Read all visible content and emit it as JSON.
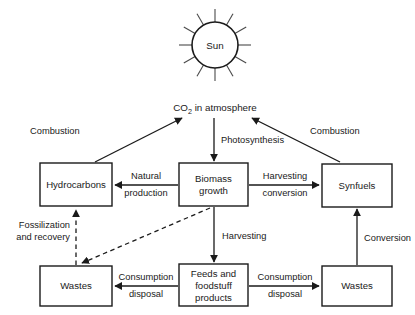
{
  "diagram": {
    "sun": {
      "label": "Sun",
      "rays": 12
    },
    "nodes": [
      {
        "id": "co2",
        "label": "CO2 in atmosphere",
        "label_main": "CO",
        "label_sub": "2",
        "label_rest": " in atmosphere",
        "shape": "text"
      },
      {
        "id": "hydrocarbons",
        "label": "Hydrocarbons",
        "lines": [
          "Hydrocarbons"
        ],
        "shape": "box"
      },
      {
        "id": "biomass",
        "label": "Biomass growth",
        "lines": [
          "Biomass",
          "growth"
        ],
        "shape": "box"
      },
      {
        "id": "synfuels",
        "label": "Synfuels",
        "lines": [
          "Synfuels"
        ],
        "shape": "box"
      },
      {
        "id": "wastes_left",
        "label": "Wastes",
        "lines": [
          "Wastes"
        ],
        "shape": "box"
      },
      {
        "id": "feeds",
        "label": "Feeds and foodstuff products",
        "lines": [
          "Feeds and",
          "foodstuff",
          "products"
        ],
        "shape": "box"
      },
      {
        "id": "wastes_right",
        "label": "Wastes",
        "lines": [
          "Wastes"
        ],
        "shape": "box"
      }
    ],
    "edges": [
      {
        "id": "combustion_left",
        "from": "hydrocarbons",
        "to": "co2",
        "label": "Combustion",
        "style": "solid"
      },
      {
        "id": "combustion_right",
        "from": "synfuels",
        "to": "co2",
        "label": "Combustion",
        "style": "solid"
      },
      {
        "id": "photosynthesis",
        "from": "co2",
        "to": "biomass",
        "label": "Photosynthesis",
        "style": "solid"
      },
      {
        "id": "natural_production",
        "from": "biomass",
        "to": "hydrocarbons",
        "label": "Natural production",
        "lines": [
          "Natural",
          "production"
        ],
        "style": "solid"
      },
      {
        "id": "harvesting_conversion",
        "from": "biomass",
        "to": "synfuels",
        "label": "Harvesting conversion",
        "lines": [
          "Harvesting",
          "conversion"
        ],
        "style": "solid"
      },
      {
        "id": "harvesting",
        "from": "biomass",
        "to": "feeds",
        "label": "Harvesting",
        "style": "solid"
      },
      {
        "id": "conversion",
        "from": "wastes_right",
        "to": "synfuels",
        "label": "Conversion",
        "style": "solid"
      },
      {
        "id": "consumption_disposal_left",
        "from": "feeds",
        "to": "wastes_left",
        "label": "Consumption disposal",
        "lines": [
          "Consumption",
          "disposal"
        ],
        "style": "solid"
      },
      {
        "id": "consumption_disposal_right",
        "from": "feeds",
        "to": "wastes_right",
        "label": "Consumption disposal",
        "lines": [
          "Consumption",
          "disposal"
        ],
        "style": "solid"
      },
      {
        "id": "fossilization_recovery",
        "from": "wastes_left",
        "to": "hydrocarbons",
        "label": "Fossilization and recovery",
        "lines": [
          "Fossilization",
          "and recovery"
        ],
        "style": "dashed"
      },
      {
        "id": "biomass_to_wastes",
        "from": "biomass",
        "to": "wastes_left",
        "label": "",
        "style": "dashed"
      }
    ],
    "colors": {
      "stroke": "#1a1a1a",
      "ray": "#4a4a4a",
      "background": "#ffffff"
    }
  }
}
